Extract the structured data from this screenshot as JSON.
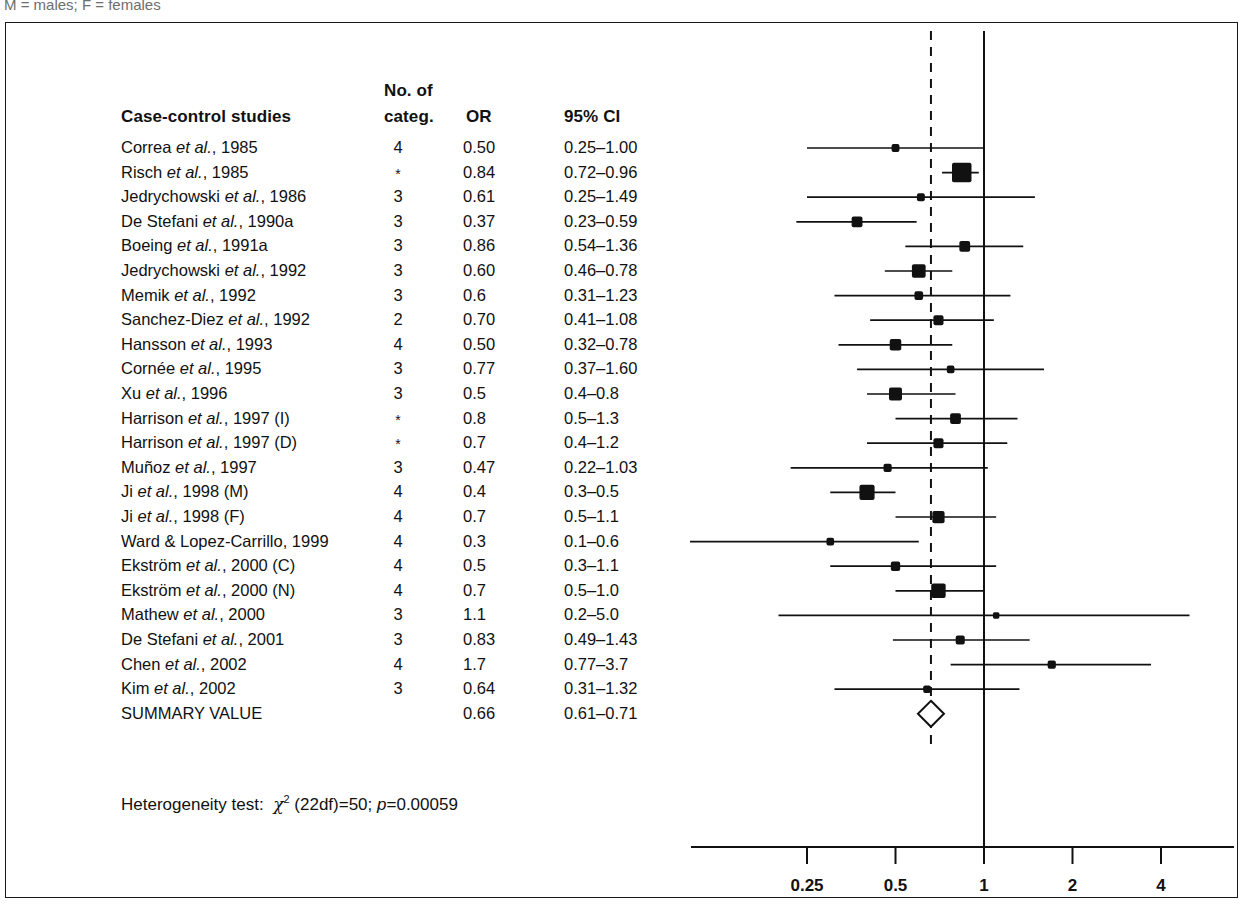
{
  "caption_fragment": "M = males; F = females",
  "table": {
    "headers": {
      "study": "Case-control studies",
      "categ_line1": "No. of",
      "categ_line2": "categ.",
      "or": "OR",
      "ci": "95% CI"
    }
  },
  "heterogeneity": {
    "prefix": "Heterogeneity test:",
    "chi": "χ",
    "sup": "2",
    "df": "(22df)=50;",
    "p_italic": "p",
    "p_value": "=0.00059"
  },
  "axis": {
    "title": "Odds ratio",
    "ticks": [
      "0.25",
      "0.5",
      "1",
      "2",
      "4"
    ],
    "tick_values": [
      0.25,
      0.5,
      1,
      2,
      4
    ],
    "reference_line": 1,
    "summary_line": 0.66
  },
  "summary_row_label": "SUMMARY VALUE",
  "chart_data": {
    "type": "forest",
    "title": "Case-control studies",
    "xlabel": "Odds ratio",
    "xscale": "log",
    "xlim": [
      0.1,
      5.5
    ],
    "reference_line": 1,
    "summary_dashed_line": 0.66,
    "columns": [
      "Case-control studies",
      "No. of categ.",
      "OR",
      "95% CI"
    ],
    "rows": [
      {
        "study": "Correa",
        "etal": true,
        "year": "1985",
        "suffix": "",
        "label": "Correa et al., 1985",
        "categ": "4",
        "or_text": "0.50",
        "ci_text": "0.25–1.00",
        "or": 0.5,
        "lo": 0.25,
        "hi": 1.0,
        "weight": 2
      },
      {
        "study": "Risch",
        "etal": true,
        "year": "1985",
        "suffix": "",
        "label": "Risch et al., 1985",
        "categ": "*",
        "or_text": "0.84",
        "ci_text": "0.72–0.96",
        "or": 0.84,
        "lo": 0.72,
        "hi": 0.96,
        "weight": 10
      },
      {
        "study": "Jedrychowski",
        "etal": true,
        "year": "1986",
        "suffix": "",
        "label": "Jedrychowski et al., 1986",
        "categ": "3",
        "or_text": "0.61",
        "ci_text": "0.25–1.49",
        "or": 0.61,
        "lo": 0.25,
        "hi": 1.49,
        "weight": 2
      },
      {
        "study": "De Stefani",
        "etal": true,
        "year": "1990a",
        "suffix": "",
        "label": "De Stefani et al., 1990a",
        "categ": "3",
        "or_text": "0.37",
        "ci_text": "0.23–0.59",
        "or": 0.37,
        "lo": 0.23,
        "hi": 0.59,
        "weight": 4
      },
      {
        "study": "Boeing",
        "etal": true,
        "year": "1991a",
        "suffix": "",
        "label": "Boeing et al., 1991a",
        "categ": "3",
        "or_text": "0.86",
        "ci_text": "0.54–1.36",
        "or": 0.86,
        "lo": 0.54,
        "hi": 1.36,
        "weight": 4
      },
      {
        "study": "Jedrychowski",
        "etal": true,
        "year": "1992",
        "suffix": "",
        "label": "Jedrychowski et al., 1992",
        "categ": "3",
        "or_text": "0.60",
        "ci_text": "0.46–0.78",
        "or": 0.6,
        "lo": 0.46,
        "hi": 0.78,
        "weight": 6
      },
      {
        "study": "Memik",
        "etal": true,
        "year": "1992",
        "suffix": "",
        "label": "Memik et al., 1992",
        "categ": "3",
        "or_text": "0.6",
        "ci_text": "0.31–1.23",
        "or": 0.6,
        "lo": 0.31,
        "hi": 1.23,
        "weight": 2.5
      },
      {
        "study": "Sanchez-Diez",
        "etal": true,
        "year": "1992",
        "suffix": "",
        "label": "Sanchez-Diez et al., 1992",
        "categ": "2",
        "or_text": "0.70",
        "ci_text": "0.41–1.08",
        "or": 0.7,
        "lo": 0.41,
        "hi": 1.08,
        "weight": 3.5
      },
      {
        "study": "Hansson",
        "etal": true,
        "year": "1993",
        "suffix": "",
        "label": "Hansson et al., 1993",
        "categ": "4",
        "or_text": "0.50",
        "ci_text": "0.32–0.78",
        "or": 0.5,
        "lo": 0.32,
        "hi": 0.78,
        "weight": 4.5
      },
      {
        "study": "Cornée",
        "etal": true,
        "year": "1995",
        "suffix": "",
        "label": "Cornée et al., 1995",
        "categ": "3",
        "or_text": "0.77",
        "ci_text": "0.37–1.60",
        "or": 0.77,
        "lo": 0.37,
        "hi": 1.6,
        "weight": 1.8
      },
      {
        "study": "Xu",
        "etal": true,
        "year": "1996",
        "suffix": "",
        "label": "Xu et al., 1996",
        "categ": "3",
        "or_text": "0.5",
        "ci_text": "0.4–0.8",
        "or": 0.5,
        "lo": 0.4,
        "hi": 0.8,
        "weight": 5.5
      },
      {
        "study": "Harrison",
        "etal": true,
        "year": "1997",
        "suffix": " (I)",
        "label": "Harrison et al., 1997 (I)",
        "categ": "*",
        "or_text": "0.8",
        "ci_text": "0.5–1.3",
        "or": 0.8,
        "lo": 0.5,
        "hi": 1.3,
        "weight": 4
      },
      {
        "study": "Harrison",
        "etal": true,
        "year": "1997",
        "suffix": " (D)",
        "label": "Harrison et al., 1997 (D)",
        "categ": "*",
        "or_text": "0.7",
        "ci_text": "0.4–1.2",
        "or": 0.7,
        "lo": 0.4,
        "hi": 1.2,
        "weight": 3.5
      },
      {
        "study": "Muñoz",
        "etal": true,
        "year": "1997",
        "suffix": "",
        "label": "Muñoz et al., 1997",
        "categ": "3",
        "or_text": "0.47",
        "ci_text": "0.22–1.03",
        "or": 0.47,
        "lo": 0.22,
        "hi": 1.03,
        "weight": 2.2
      },
      {
        "study": "Ji",
        "etal": true,
        "year": "1998",
        "suffix": " (M)",
        "label": "Ji et al., 1998 (M)",
        "categ": "4",
        "or_text": "0.4",
        "ci_text": "0.3–0.5",
        "or": 0.4,
        "lo": 0.3,
        "hi": 0.5,
        "weight": 7
      },
      {
        "study": "Ji",
        "etal": true,
        "year": "1998",
        "suffix": " (F)",
        "label": "Ji et al., 1998 (F)",
        "categ": "4",
        "or_text": "0.7",
        "ci_text": "0.5–1.1",
        "or": 0.7,
        "lo": 0.5,
        "hi": 1.1,
        "weight": 5
      },
      {
        "study": "Ward & Lopez-Carrillo,",
        "etal": false,
        "year": "1999",
        "suffix": "",
        "label": "Ward & Lopez-Carrillo, 1999",
        "categ": "4",
        "or_text": "0.3",
        "ci_text": "0.1–0.6",
        "or": 0.3,
        "lo": 0.1,
        "hi": 0.6,
        "weight": 1.8
      },
      {
        "study": "Ekström",
        "etal": true,
        "year": "2000",
        "suffix": " (C)",
        "label": "Ekström et al., 2000 (C)",
        "categ": "4",
        "or_text": "0.5",
        "ci_text": "0.3–1.1",
        "or": 0.5,
        "lo": 0.3,
        "hi": 1.1,
        "weight": 3
      },
      {
        "study": "Ekström",
        "etal": true,
        "year": "2000",
        "suffix": " (N)",
        "label": "Ekström et al., 2000 (N)",
        "categ": "4",
        "or_text": "0.7",
        "ci_text": "0.5–1.0",
        "or": 0.7,
        "lo": 0.5,
        "hi": 1.0,
        "weight": 6.5
      },
      {
        "study": "Mathew",
        "etal": true,
        "year": "2000",
        "suffix": "",
        "label": "Mathew et al., 2000",
        "categ": "3",
        "or_text": "1.1",
        "ci_text": "0.2–5.0",
        "or": 1.1,
        "lo": 0.2,
        "hi": 5.0,
        "weight": 1
      },
      {
        "study": "De Stefani",
        "etal": true,
        "year": "2001",
        "suffix": "",
        "label": "De Stefani et al., 2001",
        "categ": "3",
        "or_text": "0.83",
        "ci_text": "0.49–1.43",
        "or": 0.83,
        "lo": 0.49,
        "hi": 1.43,
        "weight": 2.8
      },
      {
        "study": "Chen",
        "etal": true,
        "year": "2002",
        "suffix": "",
        "label": "Chen et al., 2002",
        "categ": "4",
        "or_text": "1.7",
        "ci_text": "0.77–3.7",
        "or": 1.7,
        "lo": 0.77,
        "hi": 3.7,
        "weight": 2.2
      },
      {
        "study": "Kim",
        "etal": true,
        "year": "2002",
        "suffix": "",
        "label": "Kim et al., 2002",
        "categ": "3",
        "or_text": "0.64",
        "ci_text": "0.31–1.32",
        "or": 0.64,
        "lo": 0.31,
        "hi": 1.32,
        "weight": 1.8
      },
      {
        "study": "SUMMARY VALUE",
        "etal": false,
        "year": "",
        "suffix": "",
        "label": "SUMMARY VALUE",
        "categ": "",
        "or_text": "0.66",
        "ci_text": "0.61–0.71",
        "or": 0.66,
        "lo": 0.61,
        "hi": 0.71,
        "weight": 0,
        "summary": true
      }
    ]
  }
}
